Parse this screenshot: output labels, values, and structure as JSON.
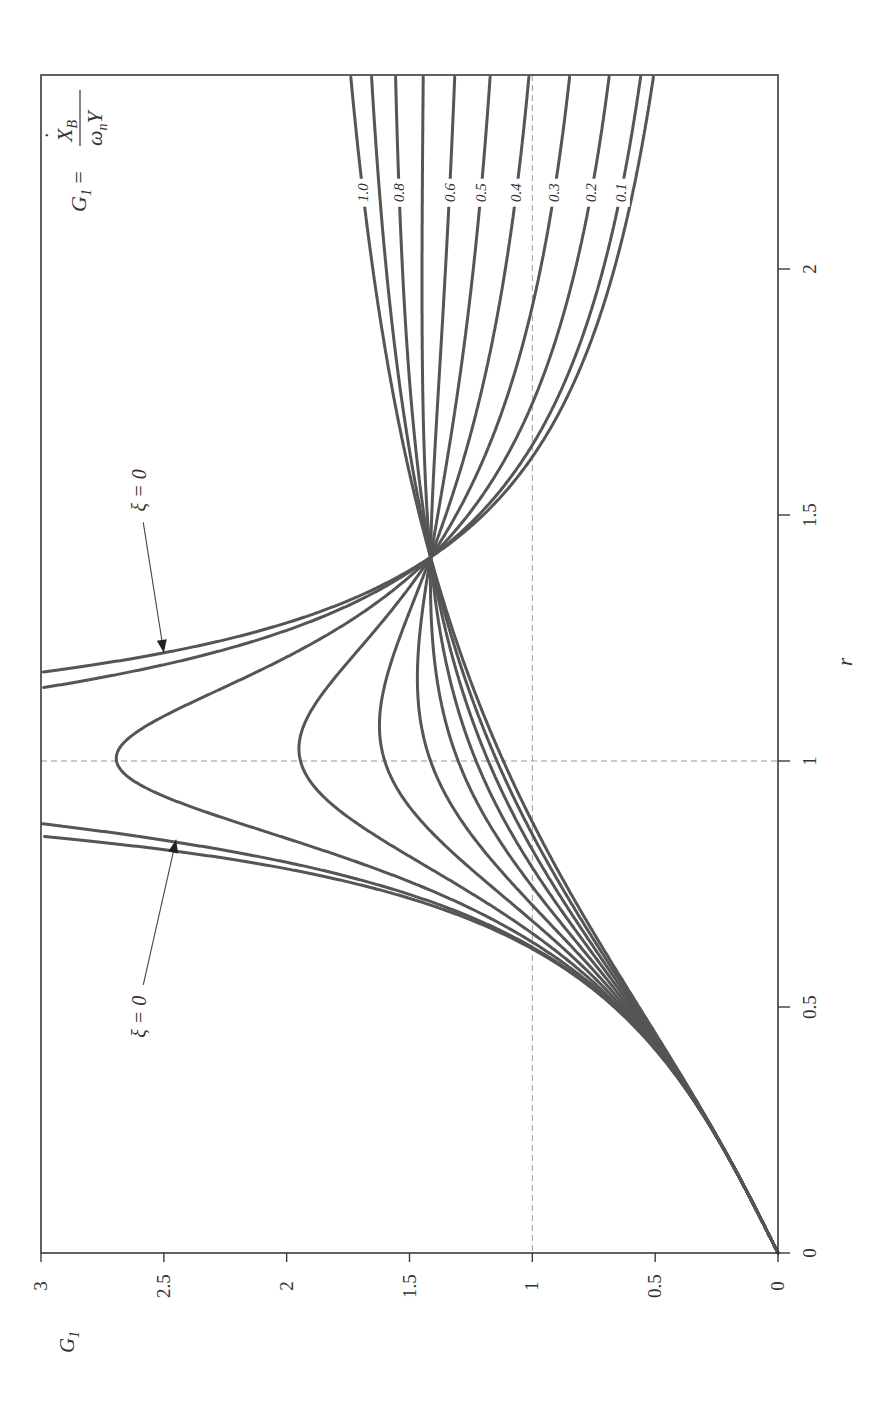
{
  "chart_data": {
    "type": "line",
    "orientation_note": "figure rotated 90 degrees clockwise on page",
    "title": "",
    "formula": {
      "lhs": "G",
      "lhs_sub": "1",
      "eq": "=",
      "numerator": "X",
      "numerator_dot": "·",
      "numerator_sub": "B",
      "denominator": "ω",
      "denominator_sub": "n",
      "denominator_tail": "Y"
    },
    "xlabel": "r",
    "ylabel": "G",
    "ylabel_sub": "1",
    "xlim": [
      0,
      2.39
    ],
    "ylim": [
      0,
      3
    ],
    "x_ticks": [
      {
        "value": 0,
        "label": "0"
      },
      {
        "value": 0.5,
        "label": "0.5"
      },
      {
        "value": 1,
        "label": "1"
      },
      {
        "value": 1.5,
        "label": "1.5"
      },
      {
        "value": 2,
        "label": "2"
      }
    ],
    "y_ticks": [
      {
        "value": 0,
        "label": "0"
      },
      {
        "value": 0.5,
        "label": "0.5"
      },
      {
        "value": 1,
        "label": "1"
      },
      {
        "value": 1.5,
        "label": "1.5"
      },
      {
        "value": 2,
        "label": "2"
      },
      {
        "value": 2.5,
        "label": "2.5"
      },
      {
        "value": 3,
        "label": "3"
      }
    ],
    "reference_lines": [
      {
        "axis": "x",
        "value": 1,
        "style": "dashed"
      },
      {
        "axis": "y",
        "value": 1,
        "style": "dashed"
      }
    ],
    "grid": false,
    "legend": "inline labels at right end of curves",
    "model": "G1 = r*sqrt(1+(2*xi*r)^2)/sqrt((1-r^2)^2+(2*xi*r)^2)",
    "crossing_point": {
      "r": 1.414,
      "G1": 1.414
    },
    "x": [
      0,
      0.25,
      0.5,
      0.75,
      1.0,
      1.25,
      1.414,
      1.75,
      2.0,
      2.4
    ],
    "series": [
      {
        "name": "ξ=0",
        "xi": 0.0,
        "label": "",
        "values": [
          0,
          0.27,
          0.67,
          1.71,
          null,
          2.22,
          1.41,
          0.76,
          0.67,
          0.5
        ]
      },
      {
        "name": "ξ=0.1",
        "xi": 0.1,
        "label": "0.1",
        "values": [
          0,
          0.27,
          0.66,
          1.64,
          5.1,
          2.09,
          1.41,
          0.89,
          0.71,
          0.56
        ]
      },
      {
        "name": "ξ=0.2",
        "xi": 0.2,
        "label": "0.2",
        "values": [
          0,
          0.27,
          0.66,
          1.48,
          2.69,
          1.86,
          1.41,
          0.98,
          0.82,
          0.69
        ]
      },
      {
        "name": "ξ=0.3",
        "xi": 0.3,
        "label": "0.3",
        "values": [
          0,
          0.27,
          0.65,
          1.31,
          1.94,
          1.67,
          1.41,
          1.1,
          0.97,
          0.85
        ]
      },
      {
        "name": "ξ=0.4",
        "xi": 0.4,
        "label": "0.4",
        "values": [
          0,
          0.27,
          0.63,
          1.18,
          1.6,
          1.54,
          1.41,
          1.21,
          1.11,
          1.01
        ]
      },
      {
        "name": "ξ=0.5",
        "xi": 0.5,
        "label": "0.5",
        "values": [
          0,
          0.27,
          0.62,
          1.08,
          1.41,
          1.46,
          1.41,
          1.3,
          1.24,
          1.17
        ]
      },
      {
        "name": "ξ=0.6",
        "xi": 0.6,
        "label": "0.6",
        "values": [
          0,
          0.27,
          0.61,
          1.01,
          1.3,
          1.41,
          1.41,
          1.38,
          1.35,
          1.32
        ]
      },
      {
        "name": "ξ=0.7",
        "xi": 0.7,
        "label": "",
        "values": [
          0,
          0.26,
          0.6,
          0.96,
          1.23,
          1.37,
          1.41,
          1.45,
          1.45,
          1.44
        ]
      },
      {
        "name": "ξ=0.8",
        "xi": 0.8,
        "label": "0.8",
        "values": [
          0,
          0.26,
          0.58,
          0.92,
          1.18,
          1.35,
          1.41,
          1.5,
          1.53,
          1.56
        ]
      },
      {
        "name": "ξ=0.9",
        "xi": 0.9,
        "label": "",
        "values": [
          0,
          0.26,
          0.57,
          0.89,
          1.14,
          1.33,
          1.41,
          1.54,
          1.59,
          1.66
        ]
      },
      {
        "name": "ξ=1.0",
        "xi": 1.0,
        "label": "1.0",
        "values": [
          0,
          0.26,
          0.57,
          0.87,
          1.12,
          1.31,
          1.41,
          1.57,
          1.65,
          1.74
        ]
      }
    ],
    "annotations": [
      {
        "text": "ξ = 0",
        "target_branch": "r > 1",
        "label_r": 1.55,
        "label_G": 2.6,
        "arrow_to_r": 1.22,
        "arrow_to_G": 2.5
      },
      {
        "text": "ξ = 0",
        "target_branch": "r < 1",
        "label_r": 0.48,
        "label_G": 2.6,
        "arrow_to_r": 0.84,
        "arrow_to_G": 2.45
      }
    ]
  }
}
